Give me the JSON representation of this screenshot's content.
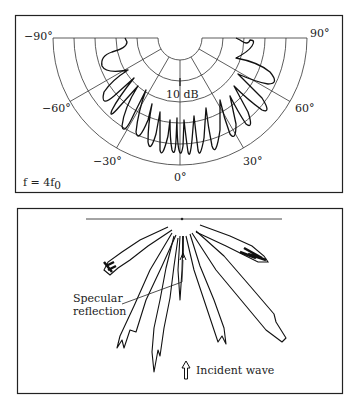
{
  "top_panel": {
    "angle_labels": {
      "neg90": "−90°",
      "pos90": "90°",
      "neg60": "−60°",
      "pos60": "60°",
      "neg30": "−30°",
      "pos30": "30°",
      "zero": "0°"
    },
    "scale_label": "10 dB",
    "frequency_label": "f = 4f",
    "frequency_subscript": "0"
  },
  "bottom_panel": {
    "specular_label_line1": "Specular",
    "specular_label_line2": "reflection",
    "incident_label": "Incident wave"
  },
  "colors": {
    "ink": "#222222",
    "background": "#ffffff"
  }
}
